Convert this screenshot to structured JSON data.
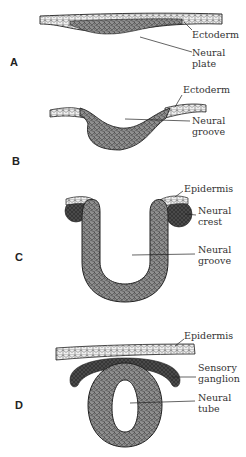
{
  "diagram": {
    "stages": [
      {
        "letter": "A",
        "labels": [
          {
            "text": "Ectoderm"
          },
          {
            "text": "Neural\nplate"
          }
        ]
      },
      {
        "letter": "B",
        "labels": [
          {
            "text": "Ectoderm"
          },
          {
            "text": "Neural\ngroove"
          }
        ]
      },
      {
        "letter": "C",
        "labels": [
          {
            "text": "Epidermis"
          },
          {
            "text": "Neural\ncrest"
          },
          {
            "text": "Neural\ngroove"
          }
        ]
      },
      {
        "letter": "D",
        "labels": [
          {
            "text": "Epidermis"
          },
          {
            "text": "Sensory\nganglion"
          },
          {
            "text": "Neural\ntube"
          }
        ]
      }
    ]
  },
  "colors": {
    "ectoderm_fill": "#e8e8e8",
    "neural_fill": "#9a9a9a",
    "crest_fill": "#555555",
    "outline": "#222222",
    "text": "#333333"
  }
}
